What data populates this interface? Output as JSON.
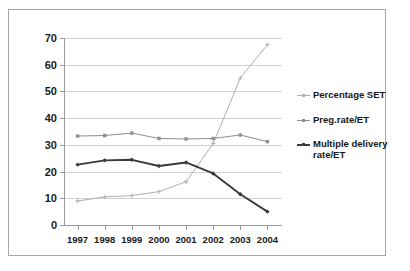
{
  "chart_data": {
    "type": "line",
    "title": "",
    "xlabel": "",
    "ylabel": "",
    "categories": [
      "1997",
      "1998",
      "1999",
      "2000",
      "2001",
      "2002",
      "2003",
      "2004"
    ],
    "ylim": [
      0,
      70
    ],
    "yticks": [
      0,
      10,
      20,
      30,
      40,
      50,
      60,
      70
    ],
    "grid": true,
    "legend_position": "right",
    "series": [
      {
        "name": "Percentage SET",
        "color": "#b0b0b0",
        "marker": "plus",
        "values": [
          9,
          10.5,
          11,
          12.5,
          16.2,
          30.5,
          55,
          67.5
        ]
      },
      {
        "name": "Preg.rate/ET",
        "color": "#8f8f8f",
        "marker": "square",
        "values": [
          33.3,
          33.5,
          34.4,
          32.4,
          32.2,
          32.4,
          33.7,
          31.2
        ]
      },
      {
        "name": "Multiple delivery rate/ET",
        "color": "#3a3a3a",
        "marker": "diamond",
        "values": [
          22.6,
          24.2,
          24.4,
          22.1,
          23.4,
          19.3,
          11.5,
          5.0
        ]
      }
    ]
  },
  "legend": {
    "items": [
      {
        "label": "Percentage SET"
      },
      {
        "label": "Preg.rate/ET"
      },
      {
        "label": "Multiple delivery rate/ET"
      }
    ]
  },
  "axes": {
    "y_tick_labels": [
      "70",
      "60",
      "50",
      "40",
      "30",
      "20",
      "10",
      "0"
    ],
    "x_tick_labels": [
      "1997",
      "1998",
      "1999",
      "2000",
      "2001",
      "2002",
      "2003",
      "2004"
    ]
  },
  "colors": {
    "frame": "#a8a8a8",
    "grid": "#d2d2d2",
    "axis": "#9b9b9b",
    "text": "#1a1a1a",
    "background": "#ffffff"
  }
}
